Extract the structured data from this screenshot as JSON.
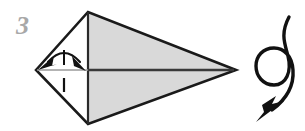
{
  "figure": {
    "kind": "origami-instruction-diagram",
    "step_number": "3",
    "canvas": {
      "width": 305,
      "height": 131,
      "background": "#ffffff"
    },
    "colors": {
      "paper_front": "#d9d9d9",
      "paper_back": "#ffffff",
      "outline": "#1a1a1a",
      "fold_line": "#555555",
      "step_number": "#a8a8a8",
      "arrow": "#111111"
    },
    "model": {
      "name": "kite-shape-with-center-fold",
      "vertices": {
        "left": [
          36,
          70
        ],
        "top": [
          88,
          12
        ],
        "bottom": [
          88,
          124
        ],
        "right": [
          236,
          70
        ]
      },
      "faces": [
        {
          "name": "upper-right-face",
          "fill": "#d9d9d9",
          "points": "88,12 236,70 88,70"
        },
        {
          "name": "lower-right-face",
          "fill": "#d9d9d9",
          "points": "88,70 236,70 88,124"
        },
        {
          "name": "upper-left-face",
          "fill": "#ffffff",
          "points": "36,70 88,12 88,70"
        },
        {
          "name": "lower-left-face",
          "fill": "#ffffff",
          "points": "36,70 88,70 88,124"
        }
      ],
      "center_fold": {
        "from": [
          36,
          70
        ],
        "to": [
          236,
          70
        ]
      }
    },
    "annotations": {
      "valley_fold_arrow": {
        "name": "double-headed-arc-arrow",
        "meaning": "fold-both-sides-in",
        "span_from": [
          44,
          70
        ],
        "span_to": [
          84,
          70
        ],
        "apex": [
          64,
          50
        ]
      },
      "alignment_tick_upper": {
        "from": [
          64,
          50
        ],
        "to": [
          64,
          64
        ]
      },
      "alignment_tick_lower": {
        "from": [
          64,
          78
        ],
        "to": [
          64,
          92
        ]
      },
      "turn_over_arrow": {
        "name": "turn-over-loop-arrow",
        "meaning": "turn the model over",
        "loop_center": [
          274,
          66
        ],
        "loop_radius": 17,
        "tail_start": [
          288,
          18
        ],
        "arrow_tip": [
          258,
          120
        ]
      }
    }
  }
}
